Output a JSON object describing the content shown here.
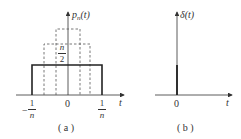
{
  "panels": [
    {
      "id": "a",
      "caption": "( a )",
      "y_label": "p",
      "y_label_sub": "n",
      "y_label_arg": "(t)",
      "x_label": "t",
      "origin_label": "0",
      "left_tick": {
        "sign": "−",
        "num": "1",
        "den": "n"
      },
      "right_tick": {
        "num": "1",
        "den": "n"
      },
      "height_label": {
        "num": "n",
        "den": "2"
      },
      "solid_pulse": {
        "x_from": "-1/n",
        "x_to": "1/n",
        "height": "n/2"
      },
      "dashed_pulses": [
        {
          "x_from": "-1/(2n)",
          "x_to": "1/(2n)",
          "height": "n"
        },
        {
          "x_from": "-1/(4n)",
          "x_to": "1/(4n)",
          "height": "2n"
        }
      ]
    },
    {
      "id": "b",
      "caption": "( b )",
      "y_label": "δ(t)",
      "x_label": "t",
      "origin_label": "0",
      "impulse_at": 0
    }
  ],
  "colors": {
    "line": "#222222",
    "dashed": "#555555",
    "axis": "#333333"
  }
}
